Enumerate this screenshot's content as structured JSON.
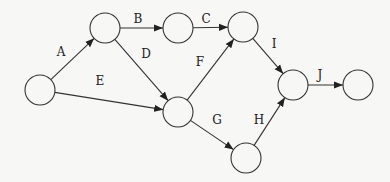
{
  "diagram": {
    "type": "activity-on-arrow network",
    "nodes": [
      {
        "id": "n1",
        "x": 40,
        "y": 90
      },
      {
        "id": "n2",
        "x": 105,
        "y": 28
      },
      {
        "id": "n3",
        "x": 178,
        "y": 28
      },
      {
        "id": "n4",
        "x": 243,
        "y": 27
      },
      {
        "id": "n5",
        "x": 178,
        "y": 112
      },
      {
        "id": "n6",
        "x": 246,
        "y": 158
      },
      {
        "id": "n7",
        "x": 293,
        "y": 85
      },
      {
        "id": "n8",
        "x": 358,
        "y": 85
      }
    ],
    "edges": [
      {
        "label": "A",
        "from": "n1",
        "to": "n2",
        "lx": 61,
        "ly": 52
      },
      {
        "label": "B",
        "from": "n2",
        "to": "n3",
        "lx": 138,
        "ly": 19
      },
      {
        "label": "C",
        "from": "n3",
        "to": "n4",
        "lx": 206,
        "ly": 19
      },
      {
        "label": "D",
        "from": "n2",
        "to": "n5",
        "lx": 146,
        "ly": 54
      },
      {
        "label": "E",
        "from": "n1",
        "to": "n5",
        "lx": 100,
        "ly": 81
      },
      {
        "label": "F",
        "from": "n5",
        "to": "n4",
        "lx": 200,
        "ly": 62
      },
      {
        "label": "G",
        "from": "n5",
        "to": "n6",
        "lx": 217,
        "ly": 120
      },
      {
        "label": "H",
        "from": "n6",
        "to": "n7",
        "lx": 259,
        "ly": 120
      },
      {
        "label": "I",
        "from": "n4",
        "to": "n7",
        "lx": 274,
        "ly": 44
      },
      {
        "label": "J",
        "from": "n7",
        "to": "n8",
        "lx": 320,
        "ly": 75
      }
    ]
  }
}
